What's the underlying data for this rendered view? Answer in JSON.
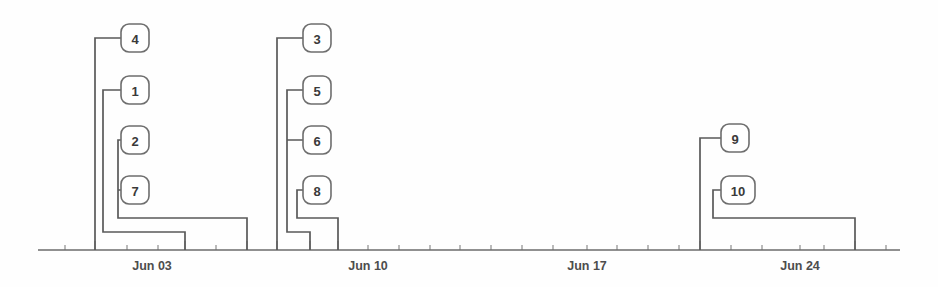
{
  "chart_data": {
    "type": "diagram",
    "title": "",
    "xlabel": "",
    "ylabel": "",
    "grid": false,
    "legend": null,
    "axis": {
      "orientation": "horizontal",
      "y_px": 250,
      "x_start_px": 38,
      "x_end_px": 900,
      "px_per_day": 30.7,
      "day_one_px": 127,
      "tick_labels": [
        "Jun 03",
        "Jun 10",
        "Jun 17",
        "Jun 24"
      ],
      "tick_label_x_px": [
        152,
        368,
        587,
        800
      ],
      "minor_tick_count": 29,
      "major_tick_days": [
        "Jun 01",
        "Jun 03",
        "Jun 05",
        "Jun 08",
        "Jun 10",
        "Jun 21",
        "Jun 27"
      ]
    },
    "groups": [
      {
        "name": "group-1",
        "span_label": "Jun 01 - Jun 05",
        "nodes": [
          "4",
          "1",
          "2",
          "7"
        ]
      },
      {
        "name": "group-2",
        "span_label": "Jun 08 - Jun 11",
        "nodes": [
          "3",
          "5",
          "6",
          "8"
        ]
      },
      {
        "name": "group-3",
        "span_label": "Jun 21 - Jun 27",
        "nodes": [
          "9",
          "10"
        ]
      }
    ],
    "nodes": [
      {
        "id": "n4",
        "label": "4",
        "box_x": 121,
        "box_y": 24,
        "box_w": 28,
        "box_h": 28,
        "stem_x": 95,
        "stem_y": 38,
        "bracket_x": 95,
        "bracket_y": 250,
        "depth": 0
      },
      {
        "id": "n1",
        "label": "1",
        "box_x": 121,
        "box_y": 76,
        "box_w": 28,
        "box_h": 28,
        "stem_x": 103,
        "stem_y": 90,
        "bracket_x": 185,
        "bracket_y": 232,
        "depth": 1
      },
      {
        "id": "n2",
        "label": "2",
        "box_x": 121,
        "box_y": 126,
        "box_w": 28,
        "box_h": 28,
        "stem_x": 118,
        "stem_y": 140,
        "bracket_x": 247,
        "bracket_y": 218,
        "depth": 2
      },
      {
        "id": "n7",
        "label": "7",
        "box_x": 121,
        "box_y": 176,
        "box_w": 28,
        "box_h": 28,
        "stem_x": 118,
        "stem_y": 190,
        "bracket_x": 247,
        "bracket_y": 218,
        "depth": 2
      },
      {
        "id": "n3",
        "label": "3",
        "box_x": 303,
        "box_y": 24,
        "box_w": 28,
        "box_h": 28,
        "stem_x": 277,
        "stem_y": 38,
        "bracket_x": 277,
        "bracket_y": 250,
        "depth": 0
      },
      {
        "id": "n5",
        "label": "5",
        "box_x": 303,
        "box_y": 76,
        "box_w": 28,
        "box_h": 28,
        "stem_x": 287,
        "stem_y": 90,
        "bracket_x": 310,
        "bracket_y": 232,
        "depth": 1
      },
      {
        "id": "n6",
        "label": "6",
        "box_x": 303,
        "box_y": 126,
        "box_w": 28,
        "box_h": 28,
        "stem_x": 287,
        "stem_y": 140,
        "bracket_x": 310,
        "bracket_y": 232,
        "depth": 1
      },
      {
        "id": "n8",
        "label": "8",
        "box_x": 303,
        "box_y": 176,
        "box_w": 28,
        "box_h": 28,
        "stem_x": 297,
        "stem_y": 190,
        "bracket_x": 338,
        "bracket_y": 218,
        "depth": 2
      },
      {
        "id": "n9",
        "label": "9",
        "box_x": 721,
        "box_y": 124,
        "box_w": 28,
        "box_h": 28,
        "stem_x": 700,
        "stem_y": 138,
        "bracket_x": 700,
        "bracket_y": 250,
        "depth": 0
      },
      {
        "id": "n10",
        "label": "10",
        "box_x": 721,
        "box_y": 176,
        "box_w": 34,
        "box_h": 28,
        "stem_x": 713,
        "stem_y": 190,
        "bracket_x": 855,
        "bracket_y": 218,
        "depth": 1
      }
    ],
    "connectors": [
      {
        "name": "connector-4",
        "d": "M 149 38 L 95 38 L 95 250"
      },
      {
        "name": "connector-1",
        "d": "M 149 90 L 103 90 L 103 232 L 185 232 L 185 250"
      },
      {
        "name": "connector-2-7",
        "d": "M 149 140 L 118 140 L 118 190 L 149 190 M 118 190 L 118 218 L 247 218 L 247 250"
      },
      {
        "name": "connector-3",
        "d": "M 331 38 L 277 38 L 277 250"
      },
      {
        "name": "connector-5-6",
        "d": "M 331 90 L 287 90 L 287 140 L 331 140 M 287 140 L 287 232 L 310 232 L 310 250"
      },
      {
        "name": "connector-8",
        "d": "M 331 190 L 297 190 L 297 218 L 338 218 L 338 250"
      },
      {
        "name": "connector-9",
        "d": "M 749 138 L 700 138 L 700 250"
      },
      {
        "name": "connector-10",
        "d": "M 755 190 L 713 190 L 713 218 L 855 218 L 855 250"
      }
    ],
    "arrows": [
      {
        "name": "arrow-into-4",
        "points": "149,31 149,45 137,38"
      },
      {
        "name": "arrow-into-1",
        "points": "149,83 149,97 137,90"
      },
      {
        "name": "arrow-into-2",
        "points": "149,133 149,147 137,140"
      },
      {
        "name": "arrow-into-7",
        "points": "149,183 149,197 137,190"
      },
      {
        "name": "arrow-into-3",
        "points": "331,31 331,45 319,38"
      },
      {
        "name": "arrow-into-5",
        "points": "331,83 331,97 319,90"
      },
      {
        "name": "arrow-into-6",
        "points": "331,133 331,147 319,140"
      },
      {
        "name": "arrow-into-8",
        "points": "331,183 331,197 319,190"
      },
      {
        "name": "arrow-into-9",
        "points": "749,131 749,145 737,138"
      },
      {
        "name": "arrow-into-10",
        "points": "755,183 755,197 743,190"
      }
    ],
    "major_ticks_px": [
      95,
      185,
      247,
      277,
      310,
      338,
      700,
      855
    ],
    "minor_ticks_px": [
      65,
      127,
      158,
      216,
      368,
      399,
      430,
      460,
      491,
      522,
      553,
      587,
      617,
      648,
      679,
      731,
      762,
      800,
      824,
      886
    ],
    "colors": {
      "line": "#5a5a5a",
      "axis": "#6b6b6b",
      "node_stroke": "#6e6e6e",
      "node_fill": "#ffffff",
      "text": "#3a3a3a",
      "axis_text": "#4d4d4d",
      "background": "#fefefe"
    }
  }
}
